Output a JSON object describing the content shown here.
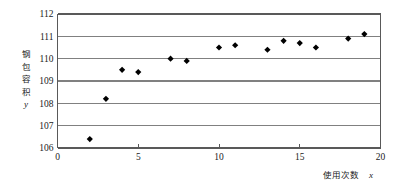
{
  "chart_data": {
    "type": "scatter",
    "title": "",
    "xlabel": "使用次数x",
    "ylabel": "钢包容积",
    "ylabel_var": "y",
    "xlabel_cn": "使用次数",
    "xlabel_var": "x",
    "x": [
      2,
      3,
      4,
      5,
      7,
      8,
      10,
      11,
      13,
      14,
      15,
      16,
      18,
      19
    ],
    "y": [
      106.4,
      108.2,
      109.5,
      109.4,
      110.0,
      109.9,
      110.5,
      110.6,
      110.4,
      110.8,
      110.7,
      110.5,
      110.9,
      111.1
    ],
    "points": [
      {
        "x": 2,
        "y": 106.4
      },
      {
        "x": 3,
        "y": 108.2
      },
      {
        "x": 4,
        "y": 109.5
      },
      {
        "x": 5,
        "y": 109.4
      },
      {
        "x": 7,
        "y": 110.0
      },
      {
        "x": 8,
        "y": 109.9
      },
      {
        "x": 10,
        "y": 110.5
      },
      {
        "x": 11,
        "y": 110.6
      },
      {
        "x": 13,
        "y": 110.4
      },
      {
        "x": 14,
        "y": 110.8
      },
      {
        "x": 15,
        "y": 110.7
      },
      {
        "x": 16,
        "y": 110.5
      },
      {
        "x": 18,
        "y": 110.9
      },
      {
        "x": 19,
        "y": 111.1
      }
    ],
    "xlim": [
      0,
      20
    ],
    "ylim": [
      106,
      112
    ],
    "xticks": [
      0,
      5,
      10,
      15,
      20
    ],
    "xtick_labels": [
      "0",
      "5",
      "10",
      "15",
      "20"
    ],
    "yticks": [
      106,
      107,
      108,
      109,
      110,
      111,
      112
    ],
    "ytick_labels": [
      "106",
      "107",
      "108",
      "109",
      "110",
      "111",
      "112"
    ],
    "grid": "horizontal",
    "legend": "none",
    "marker": "diamond",
    "marker_color": "#000000",
    "grid_color": "#808080",
    "axis_color": "#595959",
    "background": "#ffffff"
  },
  "axes": {
    "y_label_chars": [
      "钢",
      "包",
      "容",
      "积"
    ],
    "y_label_var": "y",
    "x_label_text": "使用次数",
    "x_label_var": "x"
  }
}
